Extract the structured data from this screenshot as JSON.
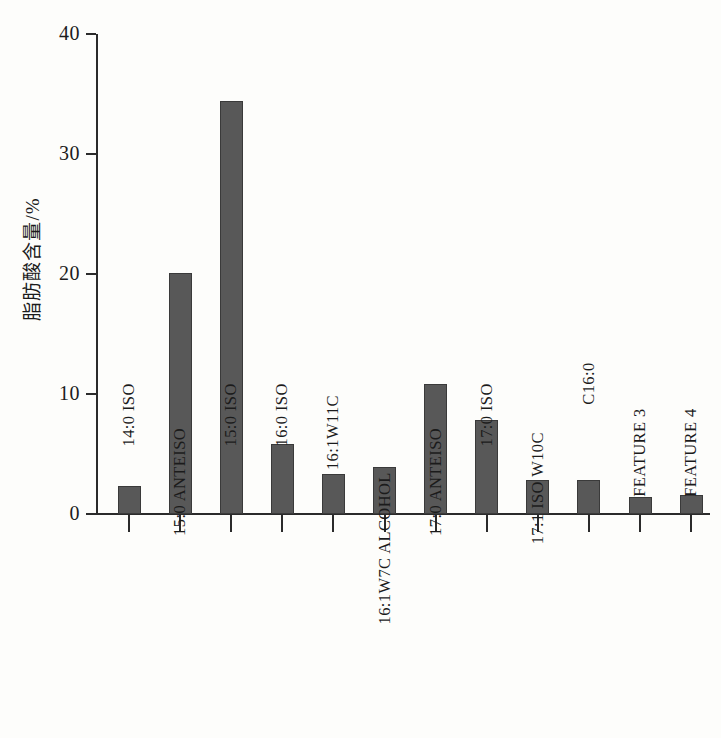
{
  "chart_data": {
    "type": "bar",
    "title": "",
    "subtitle": "",
    "xlabel": "",
    "ylabel": "脂肪酸含量/%",
    "ylim": [
      0,
      40
    ],
    "yticks": [
      0,
      10,
      20,
      30,
      40
    ],
    "grid": false,
    "legend": null,
    "bar_color": "#585858",
    "background_color": "#fdfdfb",
    "axis_color": "#2b2b2b",
    "categories": [
      "14:0 ISO",
      "15:0 ANTEISO",
      "15:0 ISO",
      "16:0 ISO",
      "16:1W11C",
      "16:1W7C ALCOHOL",
      "17:0 ANTEISO",
      "17:0 ISO",
      "17:1 ISO W10C",
      "C16:0",
      "FEATURE 3",
      "FEATURE 4"
    ],
    "values": [
      2.3,
      20.1,
      34.4,
      5.8,
      3.3,
      3.9,
      10.8,
      7.8,
      2.8,
      2.8,
      1.4,
      1.6
    ]
  }
}
